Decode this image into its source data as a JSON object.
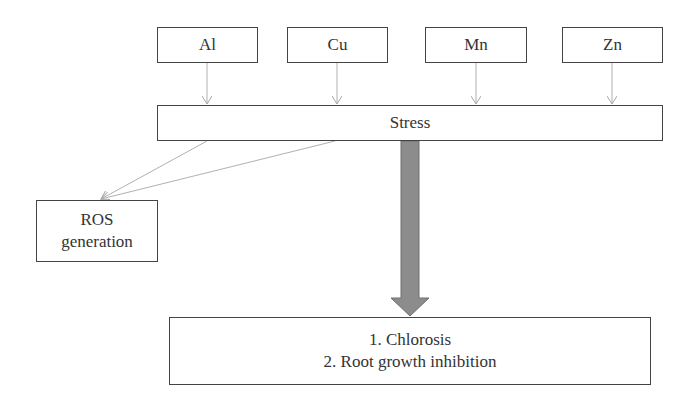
{
  "diagram": {
    "metals": [
      {
        "label": "Al"
      },
      {
        "label": "Cu"
      },
      {
        "label": "Mn"
      },
      {
        "label": "Zn"
      }
    ],
    "stress": {
      "label": "Stress"
    },
    "ros": {
      "line1": "ROS",
      "line2": "generation"
    },
    "effects": {
      "items": [
        "1. Chlorosis",
        "2. Root growth inhibition"
      ]
    },
    "colors": {
      "box_border": "#444444",
      "thin_arrow": "#b0b0b0",
      "big_arrow_fill": "#8c8c8c",
      "big_arrow_stroke": "#6e6e6e"
    }
  }
}
